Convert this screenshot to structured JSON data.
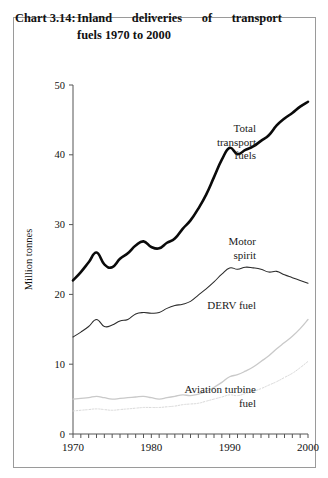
{
  "title": {
    "label": "Chart 3.14:",
    "text_line1": "Inland deliveries of transport",
    "text_line2": "fuels 1970 to 2000"
  },
  "chart_data": {
    "type": "line",
    "xlabel": "",
    "ylabel": "Million tonnes",
    "xlim": [
      1970,
      2000
    ],
    "ylim": [
      0,
      50
    ],
    "yticks": [
      0,
      10,
      20,
      30,
      40,
      50
    ],
    "xticks": [
      1970,
      1980,
      1990,
      2000
    ],
    "xtick_labels": [
      "1970",
      "1980",
      "1990",
      "2000"
    ],
    "ytick_labels": [
      "0",
      "10",
      "20",
      "30",
      "40",
      "50"
    ],
    "minor_xticks": "every year",
    "grid": false,
    "legend_position": "inline-right-labels",
    "x": [
      1970,
      1971,
      1972,
      1973,
      1974,
      1975,
      1976,
      1977,
      1978,
      1979,
      1980,
      1981,
      1982,
      1983,
      1984,
      1985,
      1986,
      1987,
      1988,
      1989,
      1990,
      1991,
      1992,
      1993,
      1994,
      1995,
      1996,
      1997,
      1998,
      1999,
      2000
    ],
    "series": [
      {
        "name": "Total transport fuels",
        "label_lines": [
          "Total",
          "transport",
          "fuels"
        ],
        "color": "#0a0a0a",
        "style": "thick-solid",
        "values": [
          22.0,
          23.2,
          24.6,
          26.0,
          24.3,
          23.9,
          25.1,
          25.9,
          27.0,
          27.6,
          26.8,
          26.6,
          27.4,
          28.0,
          29.4,
          30.6,
          32.3,
          34.3,
          36.8,
          39.3,
          41.0,
          40.1,
          40.7,
          41.2,
          42.0,
          42.8,
          44.2,
          45.2,
          46.0,
          46.9,
          47.6
        ]
      },
      {
        "name": "Motor spirit",
        "label_lines": [
          "Motor",
          "spirit"
        ],
        "color": "#2b2b2b",
        "style": "thin-solid",
        "values": [
          13.9,
          14.6,
          15.4,
          16.4,
          15.4,
          15.6,
          16.2,
          16.4,
          17.2,
          17.4,
          17.3,
          17.4,
          18.0,
          18.4,
          18.6,
          19.0,
          19.9,
          20.8,
          21.8,
          22.9,
          23.8,
          23.6,
          23.9,
          23.8,
          23.6,
          23.2,
          23.3,
          22.8,
          22.4,
          22.0,
          21.6
        ]
      },
      {
        "name": "DERV fuel",
        "label_lines": [
          "DERV fuel"
        ],
        "color": "#c9c9c9",
        "style": "light-solid",
        "values": [
          5.0,
          5.1,
          5.2,
          5.4,
          5.2,
          5.0,
          5.1,
          5.2,
          5.3,
          5.4,
          5.2,
          5.0,
          5.2,
          5.4,
          5.6,
          5.5,
          5.7,
          6.1,
          6.7,
          7.4,
          8.2,
          8.5,
          9.0,
          9.6,
          10.4,
          11.2,
          12.2,
          13.1,
          14.0,
          15.1,
          16.4
        ]
      },
      {
        "name": "Aviation turbine fuel",
        "label_lines": [
          "Aviation turbine",
          "fuel"
        ],
        "color": "#d8d8d8",
        "style": "light-dotted",
        "values": [
          3.3,
          3.4,
          3.5,
          3.6,
          3.5,
          3.4,
          3.5,
          3.6,
          3.7,
          3.8,
          3.8,
          3.8,
          3.9,
          4.0,
          4.2,
          4.3,
          4.4,
          4.7,
          5.0,
          5.3,
          5.6,
          5.5,
          5.8,
          6.1,
          6.5,
          7.0,
          7.5,
          8.1,
          8.7,
          9.5,
          10.4
        ]
      }
    ]
  }
}
